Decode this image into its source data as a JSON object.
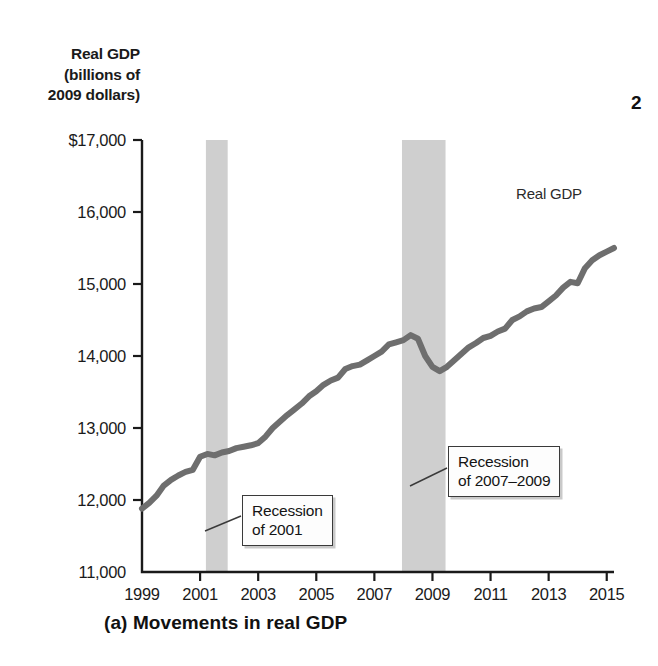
{
  "figure": {
    "caption": "(a) Movements in real GDP",
    "page_marker": "2"
  },
  "axis": {
    "y_title_line1": "Real GDP",
    "y_title_line2": "(billions of",
    "y_title_line3": "2009 dollars)"
  },
  "annotations": {
    "series_label": "Real GDP",
    "recession_2001_line1": "Recession",
    "recession_2001_line2": "of 2001",
    "recession_2007_line1": "Recession",
    "recession_2007_line2": "of 2007–2009"
  },
  "colors": {
    "line": "#6e6e6e",
    "recession_band": "#cfcfcf",
    "axis": "#1a1a1a",
    "callout_border": "#3a3a3a",
    "background": "#ffffff"
  },
  "chart_data": {
    "type": "line",
    "title": "(a) Movements in real GDP",
    "xlabel": "",
    "ylabel": "Real GDP (billions of 2009 dollars)",
    "xlim": [
      1999,
      2015.25
    ],
    "ylim": [
      11000,
      17000
    ],
    "grid": false,
    "legend_position": "inline-right",
    "y_ticks": [
      11000,
      12000,
      13000,
      14000,
      15000,
      16000,
      17000
    ],
    "y_tick_labels": [
      "11,000",
      "12,000",
      "13,000",
      "14,000",
      "15,000",
      "16,000",
      "$17,000"
    ],
    "x_ticks": [
      1999,
      2001,
      2003,
      2005,
      2007,
      2009,
      2011,
      2013,
      2015
    ],
    "x_tick_labels": [
      "1999",
      "2001",
      "2003",
      "2005",
      "2007",
      "2009",
      "2011",
      "2013",
      "2015"
    ],
    "series": [
      {
        "name": "Real GDP",
        "x": [
          1999.0,
          1999.25,
          1999.5,
          1999.75,
          2000.0,
          2000.25,
          2000.5,
          2000.75,
          2001.0,
          2001.25,
          2001.5,
          2001.75,
          2002.0,
          2002.25,
          2002.5,
          2002.75,
          2003.0,
          2003.25,
          2003.5,
          2003.75,
          2004.0,
          2004.25,
          2004.5,
          2004.75,
          2005.0,
          2005.25,
          2005.5,
          2005.75,
          2006.0,
          2006.25,
          2006.5,
          2006.75,
          2007.0,
          2007.25,
          2007.5,
          2007.75,
          2008.0,
          2008.25,
          2008.5,
          2008.75,
          2009.0,
          2009.25,
          2009.5,
          2009.75,
          2010.0,
          2010.25,
          2010.5,
          2010.75,
          2011.0,
          2011.25,
          2011.5,
          2011.75,
          2012.0,
          2012.25,
          2012.5,
          2012.75,
          2013.0,
          2013.25,
          2013.5,
          2013.75,
          2014.0,
          2014.25,
          2014.5,
          2014.75,
          2015.0,
          2015.25
        ],
        "values": [
          11880,
          11960,
          12060,
          12200,
          12280,
          12340,
          12390,
          12420,
          12600,
          12640,
          12620,
          12660,
          12680,
          12720,
          12740,
          12760,
          12790,
          12880,
          13000,
          13090,
          13180,
          13260,
          13340,
          13440,
          13510,
          13600,
          13660,
          13700,
          13820,
          13860,
          13880,
          13940,
          14000,
          14060,
          14160,
          14190,
          14220,
          14290,
          14240,
          14000,
          13850,
          13790,
          13850,
          13940,
          14030,
          14120,
          14180,
          14250,
          14280,
          14340,
          14380,
          14500,
          14550,
          14620,
          14660,
          14680,
          14760,
          14840,
          14950,
          15030,
          15010,
          15220,
          15330,
          15400,
          15450,
          15500
        ],
        "color": "#6e6e6e",
        "linewidth": 6
      }
    ],
    "shaded_regions": [
      {
        "label": "Recession of 2001",
        "x_start": 2001.2,
        "x_end": 2001.95,
        "color": "#cfcfcf"
      },
      {
        "label": "Recession of 2007–2009",
        "x_start": 2007.95,
        "x_end": 2009.45,
        "color": "#cfcfcf"
      }
    ]
  }
}
